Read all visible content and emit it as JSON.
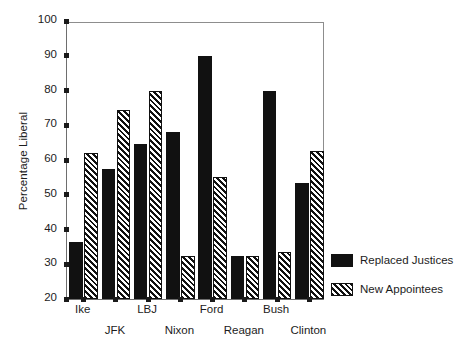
{
  "chart_data": {
    "type": "bar",
    "title": "",
    "xlabel": "",
    "ylabel": "Percentage Liberal",
    "ylim": [
      20,
      100
    ],
    "yticks": [
      20,
      30,
      40,
      50,
      60,
      70,
      80,
      90,
      100
    ],
    "ytick_labels": [
      "20",
      "30",
      "40",
      "50",
      "60",
      "70",
      "80",
      "90",
      "100"
    ],
    "grid": false,
    "legend_position": "right",
    "categories": [
      "Ike",
      "JFK",
      "LBJ",
      "Nixon",
      "Ford",
      "Reagan",
      "Bush",
      "Clinton"
    ],
    "series": [
      {
        "name": "Replaced Justices",
        "fill": "solid",
        "color": "#111111",
        "values": [
          36.5,
          57.5,
          64.5,
          68,
          90,
          32.5,
          80,
          53.5
        ]
      },
      {
        "name": "New Appointees",
        "fill": "hatched",
        "color": "#111111",
        "values": [
          62,
          74.5,
          80,
          32.5,
          55,
          32.5,
          33.5,
          62.5
        ]
      }
    ]
  },
  "legend": {
    "items": [
      {
        "label": "Replaced Justices",
        "fill": "solid"
      },
      {
        "label": "New Appointees",
        "fill": "hatched"
      }
    ]
  }
}
